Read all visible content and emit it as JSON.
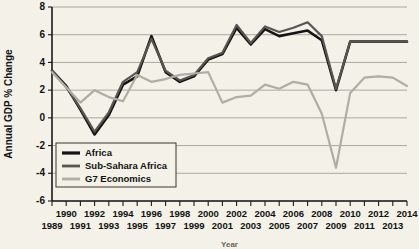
{
  "chart_data": {
    "type": "line",
    "title": "",
    "xlabel": "Year",
    "ylabel": "Annual GDP % Change",
    "xlim": [
      1989,
      2014
    ],
    "ylim": [
      -6,
      8
    ],
    "yticks": [
      -6,
      -4,
      -2,
      0,
      2,
      4,
      6,
      8
    ],
    "grid": true,
    "legend_position": "lower-left",
    "x": [
      1989,
      1990,
      1991,
      1992,
      1993,
      1994,
      1995,
      1996,
      1997,
      1998,
      1999,
      2000,
      2001,
      2002,
      2003,
      2004,
      2005,
      2006,
      2007,
      2008,
      2009,
      2010,
      2011,
      2012,
      2013,
      2014
    ],
    "xtick_labels_top": [
      "1990",
      "1992",
      "1994",
      "1996",
      "1998",
      "2000",
      "2002",
      "2004",
      "2006",
      "2008",
      "2010",
      "2012",
      "2014"
    ],
    "xtick_labels_bottom": [
      "1989",
      "1991",
      "1993",
      "1995",
      "1997",
      "1999",
      "2001",
      "2003",
      "2005",
      "2007",
      "2009",
      "2011",
      "2013"
    ],
    "series": [
      {
        "name": "Africa",
        "color": "#151515",
        "width": 2.6,
        "values": [
          3.4,
          2.3,
          0.6,
          -1.2,
          0.2,
          2.4,
          3.0,
          5.9,
          3.3,
          2.6,
          3.0,
          4.2,
          4.6,
          6.5,
          5.3,
          6.4,
          5.9,
          6.1,
          6.3,
          5.6,
          2.0,
          5.5,
          5.5,
          5.5,
          5.5,
          5.5
        ]
      },
      {
        "name": "Sub-Sahara Africa",
        "color": "#595650",
        "width": 2.2,
        "values": [
          3.4,
          2.2,
          0.7,
          -1.0,
          0.4,
          2.6,
          3.3,
          5.7,
          3.4,
          2.7,
          3.1,
          4.3,
          4.7,
          6.7,
          5.4,
          6.6,
          6.2,
          6.5,
          6.9,
          5.9,
          2.1,
          5.5,
          5.5,
          5.5,
          5.5,
          5.5
        ]
      },
      {
        "name": "G7 Economics",
        "color": "#b0ada4",
        "width": 2.2,
        "values": [
          3.3,
          2.2,
          1.1,
          2.0,
          1.5,
          1.2,
          3.1,
          2.6,
          2.8,
          3.1,
          3.2,
          3.3,
          1.1,
          1.5,
          1.6,
          2.4,
          2.1,
          2.6,
          2.4,
          0.3,
          -3.6,
          1.8,
          2.9,
          3.0,
          2.9,
          2.3
        ]
      }
    ]
  },
  "legend": {
    "items": [
      {
        "label": "Africa"
      },
      {
        "label": "Sub-Sahara Africa"
      },
      {
        "label": "G7 Economics"
      }
    ]
  }
}
